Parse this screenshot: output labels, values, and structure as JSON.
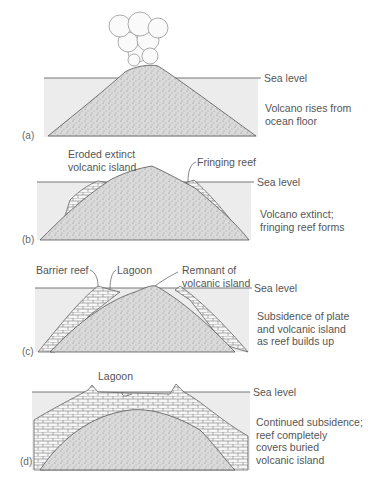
{
  "sea_level_label": "Sea level",
  "panels": [
    {
      "id": "(a)",
      "caption": "Volcano rises from\nocean floor",
      "labels": []
    },
    {
      "id": "(b)",
      "caption": "Volcano extinct;\nfringing reef forms",
      "labels": [
        "Eroded extinct\nvolcanic island",
        "Fringing reef"
      ]
    },
    {
      "id": "(c)",
      "caption": "Subsidence of plate\nand volcanic island\nas reef builds up",
      "labels": [
        "Barrier reef",
        "Lagoon",
        "Remnant of\nvolcanic island"
      ]
    },
    {
      "id": "(d)",
      "caption": "Continued subsidence;\nreef completely\ncovers buried\nvolcanic island",
      "labels": [
        "Lagoon"
      ]
    }
  ],
  "colors": {
    "water": "#ececec",
    "rock": "#d6d6d6",
    "reef": "#f4f4f4",
    "line": "#555555"
  }
}
